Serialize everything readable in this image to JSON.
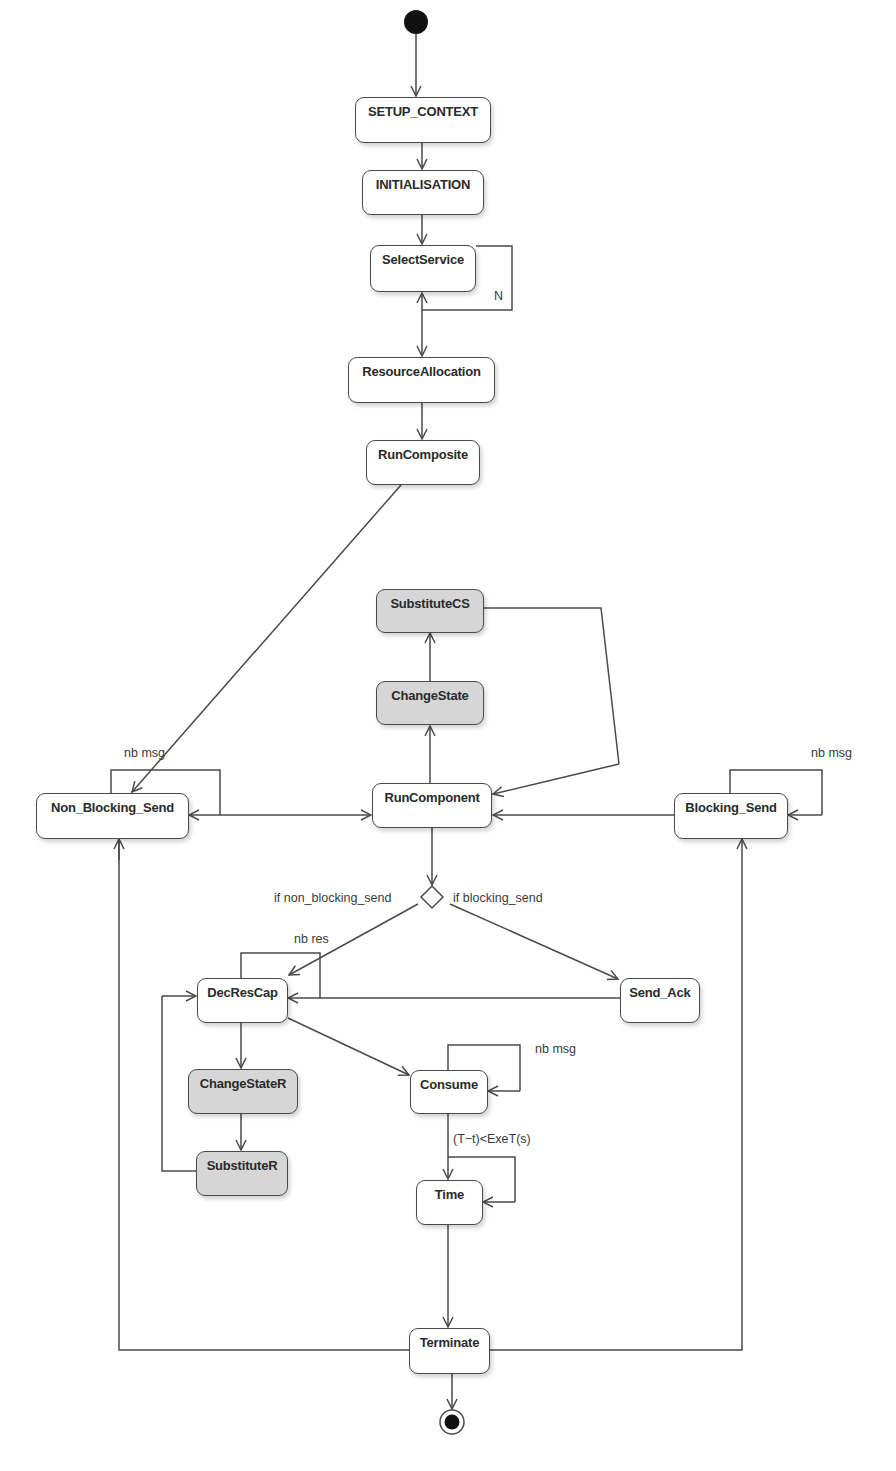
{
  "diagram": {
    "type": "UML activity/state diagram",
    "states": {
      "setup_context": "SETUP_CONTEXT",
      "initialisation": "INITIALISATION",
      "select_service": "SelectService",
      "resource_allocation": "ResourceAllocation",
      "run_composite": "RunComposite",
      "substitute_cs": "SubstituteCS",
      "change_state": "ChangeState",
      "run_component": "RunComponent",
      "non_blocking_send": "Non_Blocking_Send",
      "blocking_send": "Blocking_Send",
      "dec_res_cap": "DecResCap",
      "send_ack": "Send_Ack",
      "change_state_r": "ChangeStateR",
      "substitute_r": "SubstituteR",
      "consume": "Consume",
      "time": "Time",
      "terminate": "Terminate"
    },
    "labels": {
      "select_service_loop": "N",
      "non_blocking_loop": "nb msg",
      "blocking_loop": "nb msg",
      "guard_non_blocking": "if non_blocking_send",
      "guard_blocking": "if blocking_send",
      "dec_res_loop": "nb res",
      "consume_loop": "nb msg",
      "time_guard": "(T−t)<ExeT(s)"
    },
    "colors": {
      "line": "#4a4a4a",
      "state_fill": "#ffffff",
      "shaded_fill": "#d6d6d6",
      "node_fill": "#111111"
    }
  }
}
